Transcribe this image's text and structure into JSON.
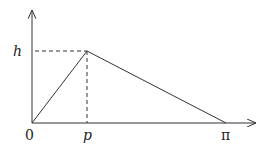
{
  "diagram": {
    "type": "triangular-function-plot",
    "labels": {
      "y_value": "h",
      "origin": "0",
      "peak_x": "p",
      "end_x": "π"
    },
    "points": {
      "origin": [
        0,
        0
      ],
      "peak": [
        "p",
        "h"
      ],
      "end": [
        "π",
        0
      ]
    },
    "line_color": "#333333"
  }
}
